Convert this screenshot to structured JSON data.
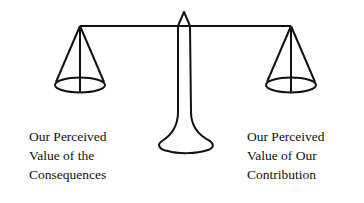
{
  "diagram": {
    "type": "balance-scale",
    "stroke_color": "#111111",
    "left_pan": {
      "label_lines": [
        "Our Perceived",
        "Value of the",
        "Consequences"
      ]
    },
    "right_pan": {
      "label_lines": [
        "Our Perceived",
        "Value of Our",
        "Contribution"
      ]
    }
  }
}
